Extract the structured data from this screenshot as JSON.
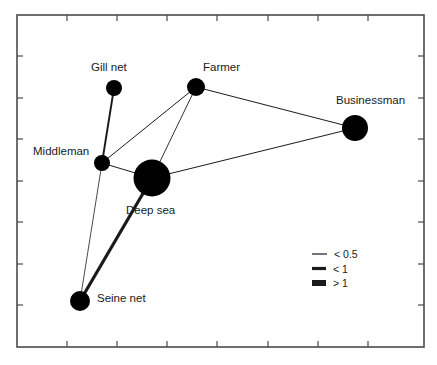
{
  "chart_data": {
    "type": "network",
    "title": "",
    "xlabel": "",
    "ylabel": "",
    "plot_frame": {
      "left": 17,
      "top": 15,
      "right": 424,
      "bottom": 347
    },
    "grid": false,
    "axis_ticks": {
      "x_positions": [
        17,
        67,
        117,
        167,
        217,
        268,
        318,
        368,
        424
      ],
      "y_positions": [
        15,
        56,
        98,
        139,
        181,
        222,
        264,
        305,
        347
      ]
    },
    "nodes": [
      {
        "id": "gill-net",
        "label": "Gill net",
        "x": 114,
        "y": 88,
        "r": 8,
        "label_x": 91,
        "label_y": 71,
        "label_anchor": "start"
      },
      {
        "id": "farmer",
        "label": "Farmer",
        "x": 196,
        "y": 87,
        "r": 9,
        "label_x": 203,
        "label_y": 71,
        "label_anchor": "start"
      },
      {
        "id": "businessman",
        "label": "Businessman",
        "x": 355,
        "y": 128,
        "r": 13,
        "label_x": 336,
        "label_y": 104,
        "label_anchor": "start"
      },
      {
        "id": "middleman",
        "label": "Middleman",
        "x": 102,
        "y": 163,
        "r": 8,
        "label_x": 33,
        "label_y": 155,
        "label_anchor": "start"
      },
      {
        "id": "deep-sea",
        "label": "Deep sea",
        "x": 152,
        "y": 178,
        "r": 18.5,
        "label_x": 126,
        "label_y": 214,
        "label_anchor": "start"
      },
      {
        "id": "seine-net",
        "label": "Seine net",
        "x": 80,
        "y": 301,
        "r": 10,
        "label_x": 97,
        "label_y": 302,
        "label_anchor": "start"
      }
    ],
    "edges": [
      {
        "source": "gill-net",
        "target": "middleman",
        "weight_class": "medium",
        "width": 1.9
      },
      {
        "source": "middleman",
        "target": "farmer",
        "weight_class": "thin",
        "width": 1.0
      },
      {
        "source": "middleman",
        "target": "deep-sea",
        "weight_class": "thin",
        "width": 1.0
      },
      {
        "source": "middleman",
        "target": "seine-net",
        "weight_class": "thin",
        "width": 0.8
      },
      {
        "source": "farmer",
        "target": "deep-sea",
        "weight_class": "thin",
        "width": 0.9
      },
      {
        "source": "farmer",
        "target": "businessman",
        "weight_class": "thin",
        "width": 1.0
      },
      {
        "source": "deep-sea",
        "target": "businessman",
        "weight_class": "thin",
        "width": 1.0
      },
      {
        "source": "deep-sea",
        "target": "seine-net",
        "weight_class": "thick",
        "width": 3.2
      }
    ],
    "legend": {
      "position": "bottom-right",
      "x": 312,
      "y": 254,
      "entries": [
        {
          "label": "< 0.5",
          "weight_class": "thin",
          "width": 1.2,
          "swatch_len": 15
        },
        {
          "label": "< 1",
          "weight_class": "medium",
          "width": 3.2,
          "swatch_len": 14
        },
        {
          "label": "> 1",
          "weight_class": "thick",
          "width": 6.0,
          "swatch_len": 14
        }
      ]
    },
    "colors": {
      "node_fill": "#000000",
      "edge_stroke": "#1a1a1a",
      "frame_stroke": "#4a4a4a",
      "text": "#1a1a1a",
      "background": "#ffffff"
    }
  }
}
